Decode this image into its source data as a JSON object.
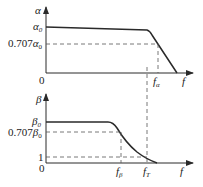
{
  "top_chart": {
    "y_axis_label": "α",
    "y_ticks": [
      {
        "base": "α",
        "sub": "0",
        "prefix": ""
      },
      {
        "base": "α",
        "sub": "0",
        "prefix": "0.707"
      }
    ],
    "origin_label": "0",
    "x_axis_label": "f",
    "x_ticks": [
      {
        "base": "f",
        "sub": "α"
      }
    ]
  },
  "bottom_chart": {
    "y_axis_label": "β",
    "y_ticks": [
      {
        "base": "β",
        "sub": "0",
        "prefix": ""
      },
      {
        "base": "β",
        "sub": "0",
        "prefix": "0.707"
      },
      {
        "base": "1",
        "sub": "",
        "prefix": ""
      }
    ],
    "origin_label": "0",
    "x_axis_label": "f",
    "x_ticks": [
      {
        "base": "f",
        "sub": "β"
      },
      {
        "base": "f",
        "sub": "T"
      }
    ]
  },
  "colors": {
    "line": "#2a2a2a",
    "dash": "#555555"
  }
}
